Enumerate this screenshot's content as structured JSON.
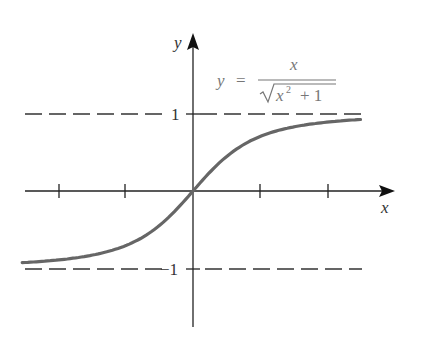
{
  "chart_data": {
    "type": "line",
    "title": "",
    "function_label": "y = x / sqrt(x^2 + 1)",
    "xlabel": "x",
    "ylabel": "y",
    "x_ticks": [
      -2,
      -1,
      1,
      2
    ],
    "y_tick_labels": [
      "1",
      "−1"
    ],
    "asymptotes": [
      1,
      -1
    ],
    "xlim": [
      -2.55,
      2.5
    ],
    "ylim": [
      -1.75,
      2.0
    ],
    "grid": false,
    "series": [
      {
        "name": "y = x / sqrt(x^2 + 1)",
        "x": [
          -2.5,
          -2,
          -1.5,
          -1,
          -0.5,
          0,
          0.5,
          1,
          1.5,
          2,
          2.5
        ],
        "values": [
          -0.93,
          -0.89,
          -0.83,
          -0.71,
          -0.45,
          0,
          0.45,
          0.71,
          0.83,
          0.89,
          0.93
        ]
      }
    ],
    "colors": {
      "curve": "#666666",
      "axes": "#222222",
      "dash": "#333333",
      "label": "#555555"
    }
  },
  "labels": {
    "x_axis": "x",
    "y_axis": "y",
    "one": "1",
    "minus_one": "−1",
    "eq_lhs": "y",
    "eq_equals": "=",
    "eq_num": "x",
    "eq_den_x": "x",
    "eq_den_exp": "2",
    "eq_den_rest": "+ 1"
  }
}
